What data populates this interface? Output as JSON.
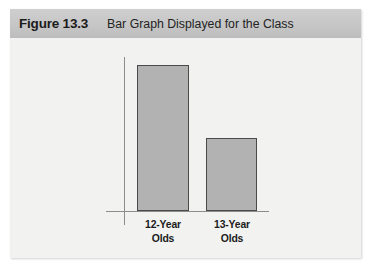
{
  "figure": {
    "number": "Figure 13.3",
    "title": "Bar Graph Displayed for the Class"
  },
  "colors": {
    "header_band": "#c6c6c6",
    "body_background": "#f2f2f1",
    "bar_fill": "#b2b2b2",
    "bar_border": "#4a4a4a",
    "axis_line": "#8d8d8d",
    "text": "#1b1b1b"
  },
  "chart_data": {
    "type": "bar",
    "title": "Bar Graph Displayed for the Class",
    "xlabel": "",
    "ylabel": "",
    "categories": [
      "12-Year Olds",
      "13-Year Olds"
    ],
    "category_lines": [
      {
        "line1": "12-Year",
        "line2": "Olds"
      },
      {
        "line1": "13-Year",
        "line2": "Olds"
      }
    ],
    "values": [
      13,
      6.5
    ],
    "ylim": [
      0,
      15
    ],
    "grid": false,
    "legend": false,
    "axis_ticks_shown": false,
    "bar_heights_px": [
      129,
      64
    ]
  }
}
